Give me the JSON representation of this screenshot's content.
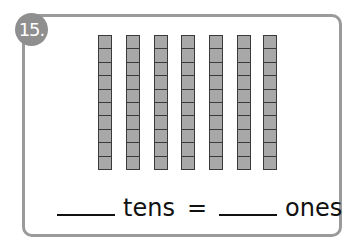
{
  "problem": {
    "number": "15.",
    "rods": {
      "count": 7,
      "cells_per_rod": 10,
      "positions_x": [
        98,
        126,
        154,
        181,
        209,
        237,
        263
      ]
    },
    "equation": {
      "tens_label": "tens",
      "equals": "=",
      "ones_label": "ones",
      "tens_value": "",
      "ones_value": ""
    },
    "colors": {
      "border": "#9a9a9a",
      "badge": "#8f8f8f",
      "rod_fill": "#a8a8a8",
      "rod_outline": "#3a3a3a"
    }
  }
}
